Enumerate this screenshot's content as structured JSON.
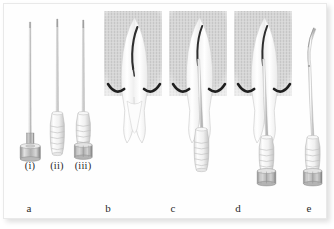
{
  "figure": {
    "background_color": "#ffffff",
    "plate_color": "#fefefe",
    "border_color": "#e9e9e9"
  },
  "colors": {
    "bone_fill": "#d2d2d2",
    "tooth_outline": "#cfcfcf",
    "tooth_fill": "#fbfbfb",
    "canal_dark": "#2e2e2e",
    "crest_arc": "#1f1f1f",
    "needle_shaft": "#b5b5b5",
    "hub_plastic": "#f4f4f4",
    "hub_outline": "#b8b8b8",
    "hub_metal": "#9a9a9a",
    "label_text": "#2b2b2b"
  },
  "panels": [
    {
      "id": "a",
      "label": "a",
      "description": "three needle types shown side by side",
      "items": [
        {
          "id": "i",
          "label": "(i)",
          "hub": "metal-disc",
          "description": "stainless steel needle with flat metal luer hub"
        },
        {
          "id": "ii",
          "label": "(ii)",
          "hub": "plastic-ribbed",
          "description": "needle with translucent ribbed plastic hub"
        },
        {
          "id": "iii",
          "label": "(iii)",
          "hub": "plastic-metal-band",
          "description": "needle with plastic ribbed hub and metal luer-lock collar"
        }
      ]
    },
    {
      "id": "b",
      "label": "b",
      "description": "tooth root in bone, no needle inserted"
    },
    {
      "id": "c",
      "label": "c",
      "description": "needle with plastic ribbed hub inserted in root canal"
    },
    {
      "id": "d",
      "label": "d",
      "description": "needle with metal luer-lock collar inserted in root canal"
    },
    {
      "id": "e",
      "label": "e",
      "description": "needle with curved working tip shown alone"
    }
  ]
}
